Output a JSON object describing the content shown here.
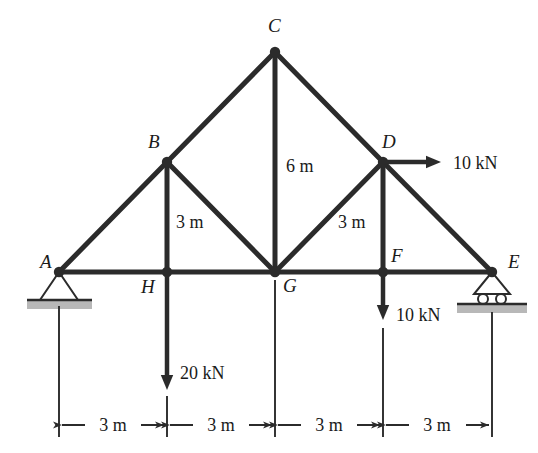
{
  "figure": {
    "type": "truss-free-body-diagram",
    "stroke_color": "#2b2b2b",
    "hatch_color": "#b8b8b8",
    "background": "#ffffff"
  },
  "nodes": [
    {
      "id": "A",
      "label": "A",
      "x": 59,
      "y": 272,
      "label_x": 40,
      "label_y": 268,
      "joint_dot": true
    },
    {
      "id": "B",
      "label": "B",
      "x": 167,
      "y": 162,
      "label_x": 148,
      "label_y": 148,
      "joint_dot": true
    },
    {
      "id": "C",
      "label": "C",
      "x": 275,
      "y": 52,
      "label_x": 268,
      "label_y": 32,
      "joint_dot": true
    },
    {
      "id": "D",
      "label": "D",
      "x": 383,
      "y": 162,
      "label_x": 382,
      "label_y": 148,
      "joint_dot": true
    },
    {
      "id": "E",
      "label": "E",
      "x": 492,
      "y": 272,
      "label_x": 508,
      "label_y": 268,
      "joint_dot": true
    },
    {
      "id": "F",
      "label": "F",
      "x": 383,
      "y": 272,
      "label_x": 391,
      "label_y": 262,
      "joint_dot": true
    },
    {
      "id": "G",
      "label": "G",
      "x": 275,
      "y": 272,
      "label_x": 283,
      "label_y": 292,
      "joint_dot": true
    },
    {
      "id": "H",
      "label": "H",
      "x": 167,
      "y": 272,
      "label_x": 141,
      "label_y": 293,
      "joint_dot": true
    }
  ],
  "members": [
    {
      "from": "A",
      "to": "B",
      "name": "member-AB"
    },
    {
      "from": "B",
      "to": "C",
      "name": "member-BC"
    },
    {
      "from": "C",
      "to": "D",
      "name": "member-CD"
    },
    {
      "from": "D",
      "to": "E",
      "name": "member-DE"
    },
    {
      "from": "A",
      "to": "H",
      "name": "member-AH"
    },
    {
      "from": "H",
      "to": "G",
      "name": "member-HG"
    },
    {
      "from": "G",
      "to": "F",
      "name": "member-GF"
    },
    {
      "from": "F",
      "to": "E",
      "name": "member-FE"
    },
    {
      "from": "B",
      "to": "H",
      "name": "member-BH"
    },
    {
      "from": "C",
      "to": "G",
      "name": "member-CG"
    },
    {
      "from": "D",
      "to": "F",
      "name": "member-DF"
    },
    {
      "from": "B",
      "to": "G",
      "name": "member-BG"
    },
    {
      "from": "D",
      "to": "G",
      "name": "member-DG"
    }
  ],
  "member_dimensions": [
    {
      "name": "height-BH",
      "text": "3 m",
      "x": 176,
      "y": 228
    },
    {
      "name": "height-CG",
      "text": "6 m",
      "x": 286,
      "y": 172
    },
    {
      "name": "height-DF",
      "text": "3 m",
      "x": 338,
      "y": 228
    }
  ],
  "supports": [
    {
      "name": "pin-support-A",
      "type": "pin",
      "at_node": "A",
      "apex_x": 59,
      "apex_y": 272,
      "base_y": 300,
      "half_width": 19,
      "ground_x": 27,
      "ground_y": 300,
      "ground_w": 65,
      "ground_h": 9
    },
    {
      "name": "roller-support-E",
      "type": "roller",
      "at_node": "E",
      "apex_x": 492,
      "apex_y": 272,
      "base_y": 294,
      "half_width": 18,
      "roller_radius": 5,
      "roller_y": 299,
      "roller_offset": 9,
      "ground_x": 457,
      "ground_y": 304,
      "ground_w": 70,
      "ground_h": 9
    }
  ],
  "loads": [
    {
      "name": "load-H-20kN",
      "label": "20 kN",
      "magnitude": 20,
      "unit": "kN",
      "direction": "down",
      "from_x": 167,
      "from_y": 272,
      "to_x": 167,
      "to_y": 390,
      "label_x": 180,
      "label_y": 379
    },
    {
      "name": "load-F-10kN",
      "label": "10 kN",
      "magnitude": 10,
      "unit": "kN",
      "direction": "down",
      "from_x": 383,
      "from_y": 272,
      "to_x": 383,
      "to_y": 320,
      "label_x": 396,
      "label_y": 321
    },
    {
      "name": "load-D-10kN",
      "label": "10 kN",
      "magnitude": 10,
      "unit": "kN",
      "direction": "right",
      "from_x": 383,
      "from_y": 162,
      "to_x": 441,
      "to_y": 162,
      "label_x": 453,
      "label_y": 169
    }
  ],
  "dimension_line": {
    "name": "span-dimension-chain",
    "y": 425,
    "extension_lines": [
      {
        "x": 59,
        "y1": 306,
        "y2": 437
      },
      {
        "x": 167,
        "y1": 396,
        "y2": 437
      },
      {
        "x": 275,
        "y1": 280,
        "y2": 437
      },
      {
        "x": 383,
        "y1": 328,
        "y2": 437
      },
      {
        "x": 492,
        "y1": 312,
        "y2": 437
      }
    ],
    "segments": [
      {
        "label": "3 m",
        "x1": 59,
        "x2": 167,
        "text_x": 113
      },
      {
        "label": "3 m",
        "x1": 167,
        "x2": 275,
        "text_x": 221
      },
      {
        "label": "3 m",
        "x1": 275,
        "x2": 383,
        "text_x": 329
      },
      {
        "label": "3 m",
        "x1": 383,
        "x2": 492,
        "text_x": 437
      }
    ]
  }
}
